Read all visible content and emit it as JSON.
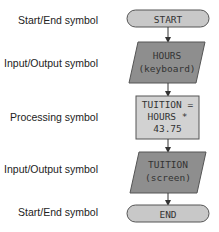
{
  "labels": {
    "start": "Start/End symbol",
    "input": "Input/Output symbol",
    "process": "Processing symbol",
    "output": "Input/Output symbol",
    "end": "Start/End symbol"
  },
  "shapes": {
    "start": {
      "type": "terminal",
      "text": "START"
    },
    "input": {
      "type": "io",
      "line1": "HOURS",
      "line2": "(keyboard)"
    },
    "process": {
      "type": "process",
      "line1": "TUITION =",
      "line2": "HOURS *",
      "line3": "43.75"
    },
    "output": {
      "type": "io",
      "line1": "TUITION",
      "line2": "(screen)"
    },
    "end": {
      "type": "terminal",
      "text": "END"
    }
  },
  "colors": {
    "terminal_fill": "#c8c8c8",
    "io_fill": "#8e8e8e",
    "process_fill": "#d2d2d2",
    "stroke": "#555555"
  }
}
